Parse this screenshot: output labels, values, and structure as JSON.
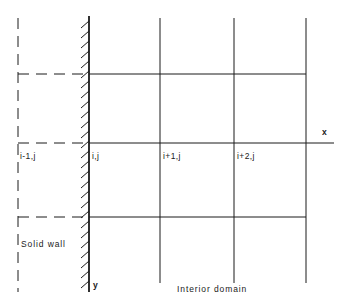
{
  "figure": {
    "kind": "finite-difference-grid-diagram",
    "width": 347,
    "height": 307,
    "background_color": "#ffffff",
    "line_color": "#1a1a1a"
  },
  "axes": {
    "x_label": "x",
    "y_label": "y"
  },
  "nodes": [
    {
      "key": "ghost",
      "label": "i-1,j",
      "x": 20,
      "y": 158
    },
    {
      "key": "wall",
      "label": "i,j",
      "x": 92,
      "y": 158
    },
    {
      "key": "interior1",
      "label": "i+1,j",
      "x": 163,
      "y": 158
    },
    {
      "key": "interior2",
      "label": "i+2,j",
      "x": 237,
      "y": 158
    }
  ],
  "annotations": {
    "solid_wall": "Solid wall",
    "interior_domain": "Interior domain"
  },
  "grid": {
    "vertical_lines": [
      {
        "name": "ghost-column",
        "x": 18,
        "style": "dashed"
      },
      {
        "name": "wall-column",
        "x": 89,
        "style": "solid-hatched"
      },
      {
        "name": "column-i-plus-1",
        "x": 160,
        "style": "solid"
      },
      {
        "name": "column-i-plus-2",
        "x": 234,
        "style": "solid"
      },
      {
        "name": "column-right-edge",
        "x": 306,
        "style": "solid"
      }
    ],
    "horizontal_lines": [
      {
        "name": "row-j-plus-1",
        "y": 74,
        "style": "dashed-left-solid-right"
      },
      {
        "name": "row-j-axis",
        "y": 143,
        "style": "dashed-left-solid-right"
      },
      {
        "name": "row-j-minus-1",
        "y": 217,
        "style": "dashed-left-solid-right"
      }
    ]
  }
}
